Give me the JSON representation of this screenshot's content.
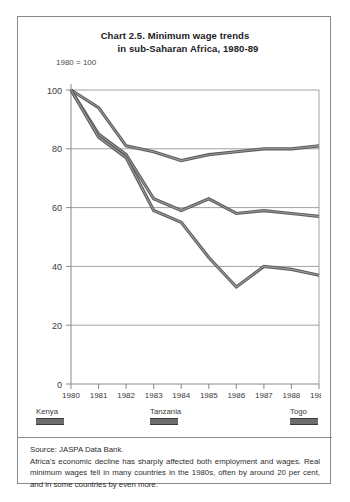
{
  "chart_title": {
    "line1": "Chart 2.5.  Minimum wage trends",
    "line2": "in sub-Saharan Africa,  1980-89"
  },
  "index_note": "1980 = 100",
  "legend": {
    "items": [
      {
        "label": "Kenya",
        "color": "#6e6e6e"
      },
      {
        "label": "Tanzania",
        "color": "#6e6e6e"
      },
      {
        "label": "Togo",
        "color": "#6e6e6e"
      }
    ]
  },
  "footer": {
    "source": "Source: JASPA Data Bank.",
    "note": "Africa's economic decline has sharply affected both employment and wages. Real minimum wages fell in many countries in the 1980s, often by around 20 per cent, and in some countries by even more."
  },
  "chart_data": {
    "type": "line",
    "title": "Chart 2.5. Minimum wage trends in sub-Saharan Africa, 1980-89",
    "xlabel": "",
    "ylabel": "1980 = 100",
    "x": [
      "1980",
      "1981",
      "1982",
      "1983",
      "1984",
      "1985",
      "1986",
      "1987",
      "1988",
      "1989"
    ],
    "xlim": [
      1980,
      1989
    ],
    "ylim": [
      0,
      100
    ],
    "yticks": [
      0,
      20,
      40,
      60,
      80,
      100
    ],
    "grid": true,
    "legend_position": "bottom",
    "series": [
      {
        "name": "Kenya",
        "color": "#6e6e6e",
        "values": [
          100,
          94,
          81,
          79,
          76,
          78,
          79,
          80,
          80,
          81
        ]
      },
      {
        "name": "Tanzania",
        "color": "#6e6e6e",
        "values": [
          100,
          85,
          78,
          63,
          59,
          63,
          58,
          59,
          58,
          57
        ]
      },
      {
        "name": "Togo",
        "color": "#6e6e6e",
        "values": [
          100,
          84,
          77,
          59,
          55,
          43,
          33,
          40,
          39,
          37
        ]
      }
    ]
  }
}
